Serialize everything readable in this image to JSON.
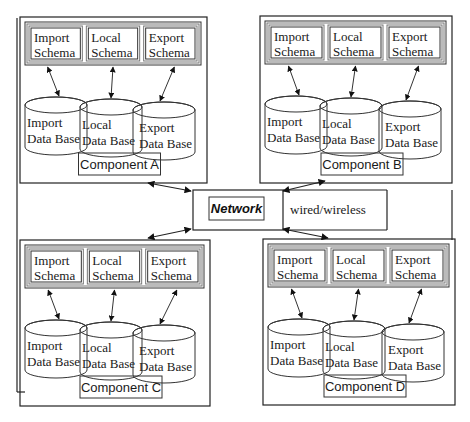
{
  "network": {
    "label": "Network",
    "connection_label": "wired/wireless"
  },
  "components": [
    {
      "id": "A",
      "label": "Component A",
      "schemas": [
        {
          "line1": "Import",
          "line2": "Schema"
        },
        {
          "line1": "Local",
          "line2": "Schema"
        },
        {
          "line1": "Export",
          "line2": "Schema"
        }
      ],
      "databases": [
        {
          "line1": "Import",
          "line2": "Data Base"
        },
        {
          "line1": "Local",
          "line2": "Data Base"
        },
        {
          "line1": "Export",
          "line2": "Data Base"
        }
      ]
    },
    {
      "id": "B",
      "label": "Component B",
      "schemas": [
        {
          "line1": "Import",
          "line2": "Schema"
        },
        {
          "line1": "Local",
          "line2": "Schema"
        },
        {
          "line1": "Export",
          "line2": "Schema"
        }
      ],
      "databases": [
        {
          "line1": "Import",
          "line2": "Data Base"
        },
        {
          "line1": "Local",
          "line2": "Data Base"
        },
        {
          "line1": "Export",
          "line2": "Data Base"
        }
      ]
    },
    {
      "id": "C",
      "label": "Component C",
      "schemas": [
        {
          "line1": "Import",
          "line2": "Schema"
        },
        {
          "line1": "Local",
          "line2": "Schema"
        },
        {
          "line1": "Export",
          "line2": "Schema"
        }
      ],
      "databases": [
        {
          "line1": "Import",
          "line2": "Data Base"
        },
        {
          "line1": "Local",
          "line2": "Data Base"
        },
        {
          "line1": "Export",
          "line2": "Data Base"
        }
      ]
    },
    {
      "id": "D",
      "label": "Component D",
      "schemas": [
        {
          "line1": "Import",
          "line2": "Schema"
        },
        {
          "line1": "Local",
          "line2": "Schema"
        },
        {
          "line1": "Export",
          "line2": "Schema"
        }
      ],
      "databases": [
        {
          "line1": "Import",
          "line2": "Data Base"
        },
        {
          "line1": "Local",
          "line2": "Data Base"
        },
        {
          "line1": "Export",
          "line2": "Data Base"
        }
      ]
    }
  ],
  "colors": {
    "stroke": "#222222",
    "background": "#ffffff"
  }
}
